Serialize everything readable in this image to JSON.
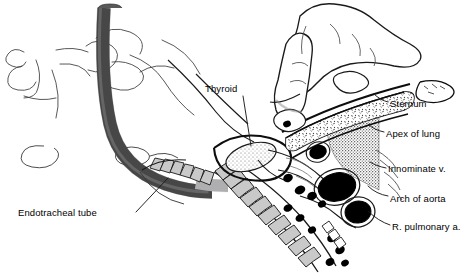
{
  "figure": {
    "background_color": "#ffffff",
    "ink_color": "#000000"
  },
  "labels": [
    {
      "id": "thyroid",
      "text": "Thyroid",
      "name": "label-thyroid"
    },
    {
      "id": "sternum",
      "text": "Sternum",
      "name": "label-sternum"
    },
    {
      "id": "apex",
      "text": "Apex of lung",
      "name": "label-apex-of-lung"
    },
    {
      "id": "innom",
      "text": "Innominate v.",
      "name": "label-innominate-vein"
    },
    {
      "id": "arch",
      "text": "Arch of aorta",
      "name": "label-arch-of-aorta"
    },
    {
      "id": "rpa",
      "text": "R. pulmonary a.",
      "name": "label-right-pulmonary-artery"
    },
    {
      "id": "ett",
      "text": "Endotracheal tube",
      "name": "label-endotracheal-tube"
    }
  ],
  "structures": {
    "endotracheal_tube": {
      "label": "Endotracheal tube",
      "fill": "#59595b",
      "cuff_fill": "#b9b9ba"
    },
    "trachea": {
      "label": "Trachea cartilage rings",
      "fill": "#c9c9ca"
    },
    "thyroid_gland": {
      "label": "Thyroid",
      "fill": "#b0b0b2"
    },
    "apex_of_lung": {
      "label": "Apex of lung",
      "fill": "#9a9a9c"
    },
    "sternum": {
      "label": "Sternum",
      "fill": "#ffffff"
    },
    "arch_of_aorta": {
      "label": "Arch of aorta",
      "fill": "#000000"
    },
    "r_pulmonary_artery": {
      "label": "R. pulmonary a.",
      "fill": "#000000"
    },
    "innominate_vein": {
      "label": "Innominate v.",
      "fill": "#000000"
    },
    "hand": {
      "label": "Palpating hand with index finger",
      "fill": "#ffffff"
    }
  }
}
